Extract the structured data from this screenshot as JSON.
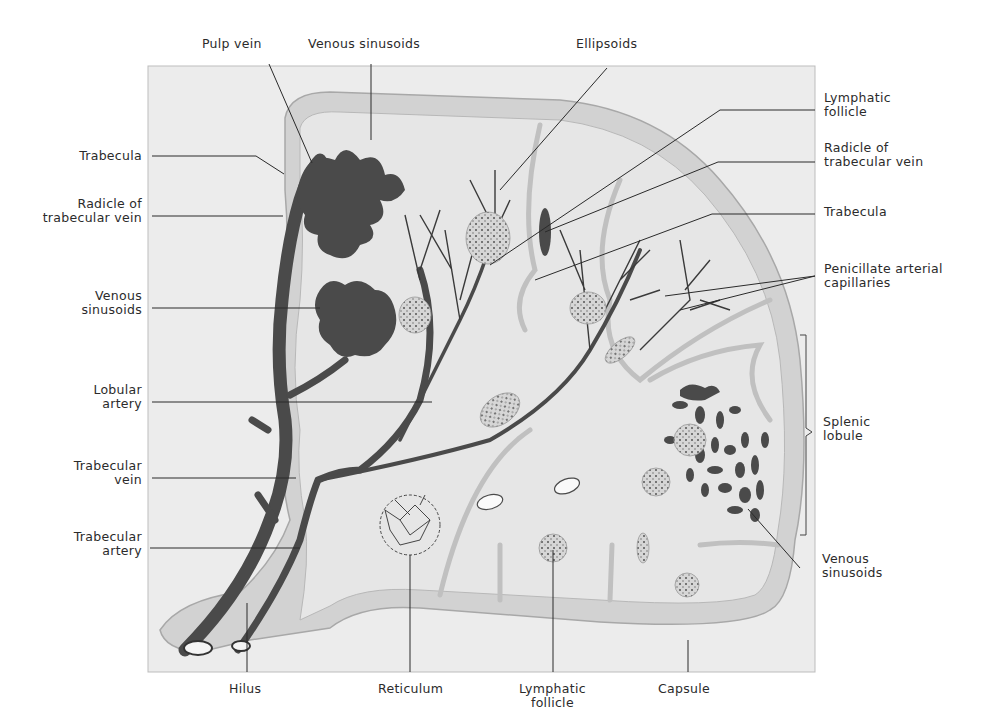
{
  "figure": {
    "colors": {
      "background": "#ffffff",
      "panel": "#ececec",
      "tissue": "#e4e4e4",
      "capsule": "#cfcfcf",
      "vessel": "#4a4a4a",
      "leader_line": "#2a2a2a",
      "label_text": "#2b2b2b"
    }
  },
  "labels": {
    "top": [
      {
        "id": "pulp-vein",
        "lines": [
          "Pulp vein"
        ]
      },
      {
        "id": "venous-sinusoids-top",
        "lines": [
          "Venous sinusoids"
        ]
      },
      {
        "id": "ellipsoids",
        "lines": [
          "Ellipsoids"
        ]
      }
    ],
    "left": [
      {
        "id": "trabecula-left",
        "lines": [
          "Trabecula"
        ]
      },
      {
        "id": "radicle-left",
        "lines": [
          "Radicle of",
          "trabecular vein"
        ]
      },
      {
        "id": "venous-sinusoids-left",
        "lines": [
          "Venous",
          "sinusoids"
        ]
      },
      {
        "id": "lobular-artery",
        "lines": [
          "Lobular",
          "artery"
        ]
      },
      {
        "id": "trabecular-vein",
        "lines": [
          "Trabecular",
          "vein"
        ]
      },
      {
        "id": "trabecular-artery",
        "lines": [
          "Trabecular",
          "artery"
        ]
      }
    ],
    "right": [
      {
        "id": "lymphatic-follicle-right",
        "lines": [
          "Lymphatic",
          "follicle"
        ]
      },
      {
        "id": "radicle-right",
        "lines": [
          "Radicle of",
          "trabecular vein"
        ]
      },
      {
        "id": "trabecula-right",
        "lines": [
          "Trabecula"
        ]
      },
      {
        "id": "penicillate",
        "lines": [
          "Penicillate arterial",
          "capillaries"
        ]
      },
      {
        "id": "splenic-lobule",
        "lines": [
          "Splenic",
          "lobule"
        ]
      },
      {
        "id": "venous-sinusoids-right",
        "lines": [
          "Venous",
          "sinusoids"
        ]
      }
    ],
    "bottom": [
      {
        "id": "hilus",
        "lines": [
          "Hilus"
        ]
      },
      {
        "id": "reticulum",
        "lines": [
          "Reticulum"
        ]
      },
      {
        "id": "lymphatic-follicle-bottom",
        "lines": [
          "Lymphatic",
          "follicle"
        ]
      },
      {
        "id": "capsule",
        "lines": [
          "Capsule"
        ]
      }
    ]
  }
}
